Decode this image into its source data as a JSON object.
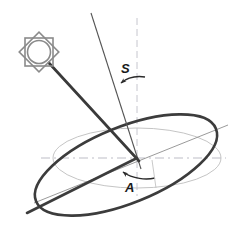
{
  "diagram": {
    "canvas": {
      "width": 245,
      "height": 229,
      "background": "#ffffff"
    },
    "labels": {
      "axis_tilt": "S",
      "orbit_inclination": "A"
    },
    "colors": {
      "orbit_ellipse": "#3a3a3a",
      "reference_ellipse": "#b5b5b5",
      "sun_icon": "#8a8a8a",
      "sun_ray": "#3a3a3a",
      "rotation_axis": "#4a4a4a",
      "dashed_reference": "#b0b0b8",
      "node_line": "#555555",
      "label": "#1a1a1a",
      "background": "#ffffff"
    },
    "elements": {
      "sun_icon_name": "sun-icon",
      "sun_ray_name": "sun-ray-line",
      "rotation_axis_name": "rotation-axis-line",
      "orbit_ellipse_name": "orbit-ellipse",
      "reference_ellipse_name": "reference-plane-ellipse",
      "node_line_name": "line-of-nodes",
      "vertical_dashed_name": "vertical-reference-dashed-line",
      "horizontal_dashed_name": "horizontal-reference-dashed-line",
      "angle_s_arc_name": "angle-s-arc",
      "angle_a_arc_name": "angle-a-arc"
    },
    "geometry": {
      "center": {
        "x": 137,
        "y": 158
      },
      "sun_center": {
        "x": 39,
        "y": 52
      },
      "sun_radius": 17,
      "sun_circle_radius": 11,
      "rotation_axis_top": {
        "x": 91,
        "y": 13
      },
      "orbit_ellipse": {
        "cx": 126,
        "cy": 165,
        "rx": 97,
        "ry": 38,
        "rotation_deg": -22
      },
      "reference_ellipse": {
        "cx": 137,
        "cy": 158,
        "rx": 84,
        "ry": 30,
        "rotation_deg": 0
      },
      "vertical_dashed": {
        "x": 137,
        "y1": 18,
        "y2": 196
      },
      "horizontal_dashed": {
        "y": 158,
        "x1": 41,
        "x2": 226
      }
    }
  }
}
